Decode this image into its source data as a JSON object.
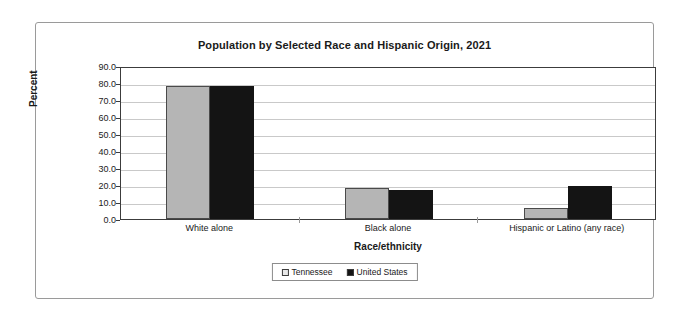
{
  "chart_data": {
    "type": "bar",
    "title": "Population by Selected Race and Hispanic Origin, 2021",
    "xlabel": "Race/ethnicity",
    "ylabel": "Percent",
    "categories": [
      "White alone",
      "Black alone",
      "Hispanic or Latino (any race)"
    ],
    "series": [
      {
        "name": "Tennessee",
        "color": "#b5b5b5",
        "values": [
          78.5,
          18.5,
          6.5
        ]
      },
      {
        "name": "United States",
        "color": "#141414",
        "values": [
          78.5,
          16.8,
          19.5
        ]
      }
    ],
    "ylim": [
      0,
      90
    ],
    "yticks": [
      "0.0",
      "10.0",
      "20.0",
      "30.0",
      "40.0",
      "50.0",
      "60.0",
      "70.0",
      "80.0",
      "90.0"
    ],
    "ytick_values": [
      0,
      10,
      20,
      30,
      40,
      50,
      60,
      70,
      80,
      90
    ],
    "grid": true,
    "legend_position": "bottom"
  }
}
